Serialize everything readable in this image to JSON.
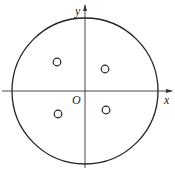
{
  "diagram": {
    "axes": {
      "x_label": "x",
      "y_label": "y",
      "origin_label": "O"
    },
    "shapes": [
      {
        "type": "large-circle",
        "description": "circle centered at origin"
      },
      {
        "type": "small-circle",
        "quadrant": "II"
      },
      {
        "type": "small-circle",
        "quadrant": "I"
      },
      {
        "type": "small-circle",
        "quadrant": "III"
      },
      {
        "type": "small-circle",
        "quadrant": "IV"
      }
    ]
  }
}
